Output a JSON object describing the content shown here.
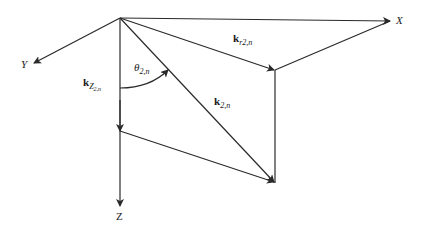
{
  "diagram": {
    "axes": {
      "x_label": "X",
      "y_label": "Y",
      "z_label": "Z"
    },
    "vectors": {
      "k_total": {
        "symbol": "k",
        "subscript": "2,n"
      },
      "k_r": {
        "symbol": "k",
        "subscript_main": "r",
        "subscript": "2,n"
      },
      "k_z": {
        "symbol": "k",
        "subscript_main": "Z",
        "subscript": "2,n"
      }
    },
    "angle": {
      "symbol": "θ",
      "subscript": "2,n"
    },
    "stroke_color": "#2a2a2a",
    "points": {
      "origin": [
        120,
        18
      ],
      "x_axis_end": [
        392,
        21
      ],
      "y_axis_end": [
        32,
        64
      ],
      "z_axis_end": [
        120,
        208
      ],
      "kr_tip": [
        275,
        70
      ],
      "k_tip": [
        275,
        183
      ],
      "kz_tip": [
        120,
        132
      ]
    }
  }
}
